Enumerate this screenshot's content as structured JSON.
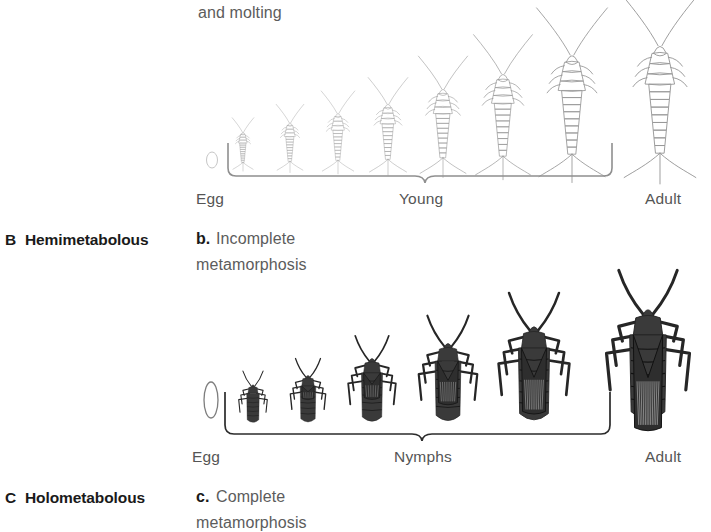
{
  "figure": {
    "background": "#ffffff",
    "top_text": "and molting"
  },
  "panels": [
    {
      "id": "A",
      "panel_letter": "",
      "panel_name": "",
      "caption_letter": "",
      "caption_line1": "",
      "caption_line2": "",
      "insect_type": "silverfish",
      "stages": {
        "egg": "Egg",
        "middle": "Young",
        "adult": "Adult"
      },
      "young_count": 7,
      "line_color": "#9a9a9a"
    },
    {
      "id": "B",
      "panel_letter": "B",
      "panel_name": "Hemimetabolous",
      "caption_letter": "b.",
      "caption_line1": "Incomplete",
      "caption_line2": "metamorphosis",
      "insect_type": "true-bug",
      "stages": {
        "egg": "Egg",
        "middle": "Nymphs",
        "adult": "Adult"
      },
      "young_count": 5,
      "line_color": "#2b2b2b"
    },
    {
      "id": "C",
      "panel_letter": "C",
      "panel_name": "Holometabolous",
      "caption_letter": "c.",
      "caption_line1": "Complete",
      "caption_line2": "metamorphosis",
      "insect_type": "",
      "stages": {},
      "young_count": 0,
      "line_color": "#2b2b2b"
    }
  ],
  "colors": {
    "heading_text": "#1a1a1a",
    "caption_text": "#5c5c5c",
    "stage_label": "#555555",
    "silverfish_stroke": "#9a9a9a",
    "bug_fill": "#3a3a3a",
    "brace_light": "#8f8f8f",
    "brace_dark": "#2b2b2b"
  }
}
